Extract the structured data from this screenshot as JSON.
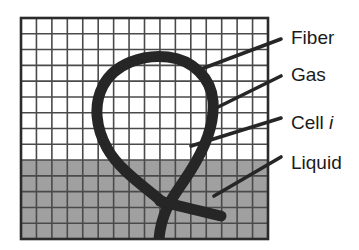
{
  "figure": {
    "domain_region": {
      "x": 21,
      "y": 18,
      "width": 247,
      "height": 221,
      "cols": 16,
      "rows": 14,
      "cell_width": 15.4,
      "cell_height": 15.8,
      "border_color": "#2b2b2b",
      "grid_line_color": "#4a4a4a"
    },
    "regions": [
      {
        "name": "gas",
        "label": "Gas",
        "fill": "#ffffff",
        "rows_from_top": 9,
        "y_top": 18,
        "y_bottom": 160
      },
      {
        "name": "liquid",
        "label": "Liquid",
        "fill": "#a0a0a0",
        "rows_from_top": 5,
        "y_top": 160,
        "y_bottom": 239
      }
    ],
    "fiber": {
      "name": "Fiber",
      "color": "#262626",
      "stroke_width": 11,
      "description": "Thick looped fiber forming a teardrop loop in the gas region that crosses itself in the liquid region and has two free ends"
    },
    "labels": [
      {
        "id": "fiber",
        "text": "Fiber",
        "text_x": 291,
        "text_y": 39,
        "leader": {
          "x1": 196,
          "y1": 71,
          "x2": 281,
          "y2": 39
        }
      },
      {
        "id": "gas",
        "text": "Gas",
        "text_x": 291,
        "text_y": 76,
        "leader": {
          "x1": 212,
          "y1": 110,
          "x2": 281,
          "y2": 76
        }
      },
      {
        "id": "cell-i",
        "text": "Cell ",
        "text_italic": "i",
        "text_x": 291,
        "text_y": 124,
        "leader": {
          "x1": 191,
          "y1": 146,
          "x2": 281,
          "y2": 118
        }
      },
      {
        "id": "liquid",
        "text": "Liquid",
        "text_x": 291,
        "text_y": 164,
        "leader": {
          "x1": 214,
          "y1": 196,
          "x2": 281,
          "y2": 157
        }
      }
    ],
    "leader_color": "#262626",
    "leader_width": 3.6
  }
}
